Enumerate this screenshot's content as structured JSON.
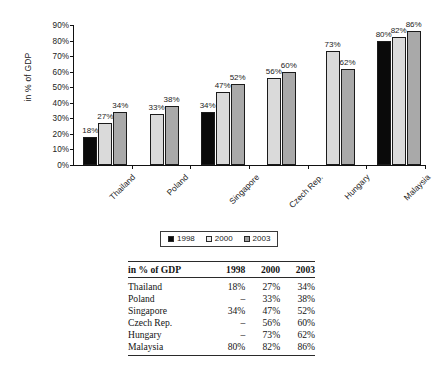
{
  "chart_data": {
    "type": "bar",
    "title": "",
    "xlabel": "",
    "ylabel": "in % of GDP",
    "ylim": [
      0,
      90
    ],
    "ytick_labels": [
      "0%",
      "10%",
      "20%",
      "30%",
      "40%",
      "50%",
      "60%",
      "70%",
      "80%",
      "90%"
    ],
    "ytick_values": [
      0,
      10,
      20,
      30,
      40,
      50,
      60,
      70,
      80,
      90
    ],
    "grid": false,
    "legend_position": "below-plot-center",
    "categories": [
      "Thailand",
      "Poland",
      "Singapore",
      "Czech Rep.",
      "Hungary",
      "Malaysia"
    ],
    "series": [
      {
        "name": "1998",
        "color": "#0a0a0a",
        "values": [
          18,
          null,
          34,
          null,
          null,
          80
        ],
        "labels": [
          "18%",
          "",
          "34%",
          "",
          "",
          "80%"
        ]
      },
      {
        "name": "2000",
        "color": "#dadada",
        "values": [
          27,
          33,
          47,
          56,
          73,
          82
        ],
        "labels": [
          "27%",
          "33%",
          "47%",
          "56%",
          "73%",
          "82%"
        ]
      },
      {
        "name": "2003",
        "color": "#a9a9a9",
        "values": [
          34,
          38,
          52,
          60,
          62,
          86
        ],
        "labels": [
          "34%",
          "38%",
          "52%",
          "60%",
          "62%",
          "86%"
        ]
      }
    ]
  },
  "legend": {
    "entries": [
      {
        "label": "1998"
      },
      {
        "label": "2000"
      },
      {
        "label": "2003"
      }
    ]
  },
  "table": {
    "columns": [
      "in % of GDP",
      "1998",
      "2000",
      "2003"
    ],
    "rows": [
      {
        "name": "Thailand",
        "v1998": "18%",
        "v2000": "27%",
        "v2003": "34%"
      },
      {
        "name": "Poland",
        "v1998": "–",
        "v2000": "33%",
        "v2003": "38%"
      },
      {
        "name": "Singapore",
        "v1998": "34%",
        "v2000": "47%",
        "v2003": "52%"
      },
      {
        "name": "Czech Rep.",
        "v1998": "–",
        "v2000": "56%",
        "v2003": "60%"
      },
      {
        "name": "Hungary",
        "v1998": "–",
        "v2000": "73%",
        "v2003": "62%"
      },
      {
        "name": "Malaysia",
        "v1998": "80%",
        "v2000": "82%",
        "v2003": "86%"
      }
    ]
  }
}
